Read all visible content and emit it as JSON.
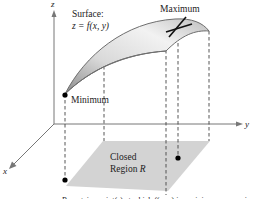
{
  "figure": {
    "axes": {
      "z_label": "z",
      "y_label": "y",
      "x_label": "x"
    },
    "surface": {
      "title": "Surface:",
      "equation_prefix": "z = ",
      "equation_f": "f",
      "equation_args": "(x, y)"
    },
    "annotations": {
      "maximum": "Maximum",
      "minimum": "Minimum"
    },
    "region": {
      "line1": "Closed",
      "line2_prefix": "Region ",
      "line2_var": "R"
    },
    "caption": "R contains point(s) at which f(x, y) is a minimum or maximum.",
    "colors": {
      "region_fill": "#d3d3d3",
      "surface_fill": "#dcdcdc",
      "surface_edge": "#6e6e6e",
      "axis": "#777777",
      "dashed": "#444444"
    }
  }
}
